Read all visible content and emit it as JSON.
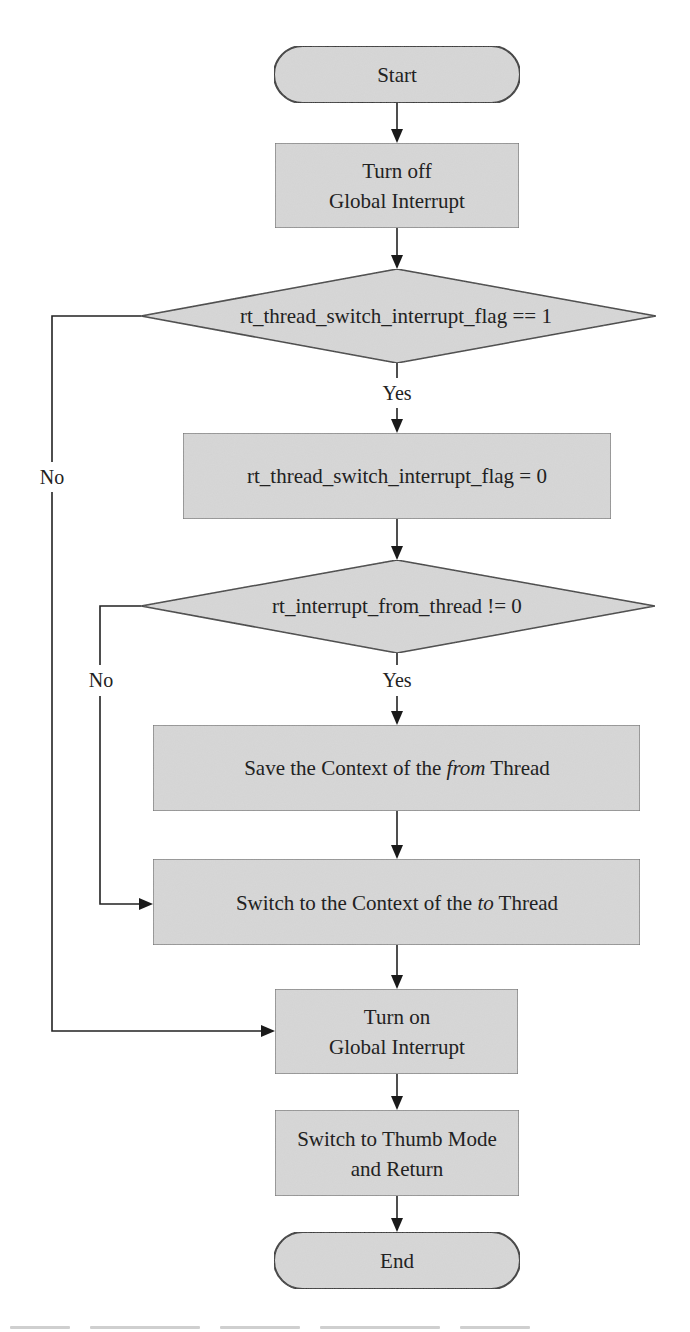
{
  "diagram": {
    "type": "flowchart",
    "colors": {
      "node_fill": "#d8d8d8",
      "stroke": "#2e2e2e",
      "background": "#ffffff"
    },
    "nodes": {
      "start": {
        "shape": "terminator",
        "label": "Start"
      },
      "turn_off": {
        "shape": "process",
        "line1": "Turn off",
        "line2": "Global Interrupt"
      },
      "decision1": {
        "shape": "decision",
        "label": "rt_thread_switch_interrupt_flag == 1"
      },
      "set_flag": {
        "shape": "process",
        "label": "rt_thread_switch_interrupt_flag = 0"
      },
      "decision2": {
        "shape": "decision",
        "label": "rt_interrupt_from_thread != 0"
      },
      "save_ctx": {
        "shape": "process",
        "pre": "Save the Context of the ",
        "em": "from",
        "post": " Thread"
      },
      "switch_ctx": {
        "shape": "process",
        "pre": "Switch to the Context of the ",
        "em": "to",
        "post": " Thread"
      },
      "turn_on": {
        "shape": "process",
        "line1": "Turn on",
        "line2": "Global Interrupt"
      },
      "thumb": {
        "shape": "process",
        "line1": "Switch to Thumb Mode",
        "line2": "and Return"
      },
      "end": {
        "shape": "terminator",
        "label": "End"
      }
    },
    "edges": [
      {
        "from": "start",
        "to": "turn_off"
      },
      {
        "from": "turn_off",
        "to": "decision1"
      },
      {
        "from": "decision1",
        "to": "set_flag",
        "label": "Yes"
      },
      {
        "from": "decision1",
        "to": "turn_on",
        "label": "No"
      },
      {
        "from": "set_flag",
        "to": "decision2"
      },
      {
        "from": "decision2",
        "to": "save_ctx",
        "label": "Yes"
      },
      {
        "from": "decision2",
        "to": "switch_ctx",
        "label": "No"
      },
      {
        "from": "save_ctx",
        "to": "switch_ctx"
      },
      {
        "from": "switch_ctx",
        "to": "turn_on"
      },
      {
        "from": "turn_on",
        "to": "thumb"
      },
      {
        "from": "thumb",
        "to": "end"
      }
    ],
    "branch_labels": {
      "yes1": "Yes",
      "no1": "No",
      "yes2": "Yes",
      "no2": "No"
    }
  }
}
